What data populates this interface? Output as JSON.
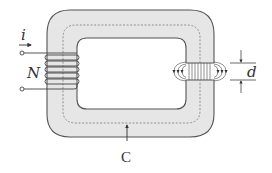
{
  "figure": {
    "type": "magnetic-circuit",
    "labels": {
      "current": "i",
      "turns": "N",
      "gap": "d",
      "path": "C"
    },
    "colors": {
      "core_fill": "#e6e6e6",
      "outline": "#555555",
      "dashed_path": "#888888",
      "text": "#333333"
    },
    "components": [
      {
        "name": "core",
        "shape": "rounded-rectangle-ring"
      },
      {
        "name": "coil",
        "turns_drawn": 5,
        "location": "left-leg"
      },
      {
        "name": "air-gap",
        "location": "right-leg",
        "fringing_field_lines": true
      },
      {
        "name": "mean-path-C",
        "style": "dashed"
      }
    ]
  }
}
